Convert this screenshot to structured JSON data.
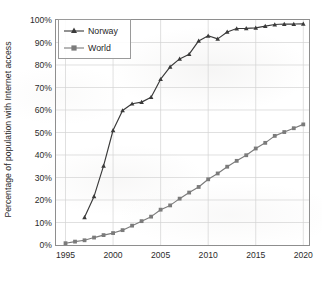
{
  "chart_data": {
    "type": "line",
    "title": "",
    "xlabel": "",
    "ylabel": "Percentage of population with Internet access",
    "xlim": [
      1994,
      2020.6
    ],
    "ylim": [
      0,
      100
    ],
    "grid": true,
    "legend_position": "top-left",
    "x_ticks": [
      "1995",
      "2000",
      "2005",
      "2010",
      "2015",
      "2020"
    ],
    "x_tick_values": [
      1995,
      2000,
      2005,
      2010,
      2015,
      2020
    ],
    "y_ticks": [
      "0%",
      "10%",
      "20%",
      "30%",
      "40%",
      "50%",
      "60%",
      "70%",
      "80%",
      "90%",
      "100%"
    ],
    "y_tick_values": [
      0,
      10,
      20,
      30,
      40,
      50,
      60,
      70,
      80,
      90,
      100
    ],
    "series": [
      {
        "name": "Norway",
        "marker": "triangle",
        "color": "#3a3a3a",
        "x": [
          1997,
          1998,
          1999,
          2000,
          2001,
          2002,
          2003,
          2004,
          2005,
          2006,
          2007,
          2008,
          2009,
          2010,
          2011,
          2012,
          2013,
          2014,
          2015,
          2016,
          2017,
          2018,
          2019,
          2020
        ],
        "values": [
          12.3,
          21.6,
          35.2,
          51.0,
          59.8,
          62.8,
          63.5,
          65.7,
          73.7,
          79.2,
          82.7,
          84.8,
          90.7,
          93.0,
          91.6,
          94.7,
          96.2,
          96.3,
          96.5,
          97.3,
          98.0,
          98.2,
          98.2,
          98.3
        ]
      },
      {
        "name": "World",
        "marker": "square",
        "color": "#7b7b7b",
        "x": [
          1995,
          1996,
          1997,
          1998,
          1999,
          2000,
          2001,
          2002,
          2003,
          2004,
          2005,
          2006,
          2007,
          2008,
          2009,
          2010,
          2011,
          2012,
          2013,
          2014,
          2015,
          2016,
          2017,
          2018,
          2019,
          2020
        ],
        "values": [
          0.8,
          1.5,
          2.1,
          3.3,
          4.4,
          5.3,
          6.6,
          8.6,
          10.6,
          12.6,
          15.7,
          17.6,
          20.6,
          23.3,
          25.8,
          29.2,
          31.8,
          34.8,
          37.4,
          39.9,
          42.9,
          45.4,
          48.5,
          50.2,
          51.9,
          53.6
        ]
      }
    ]
  }
}
